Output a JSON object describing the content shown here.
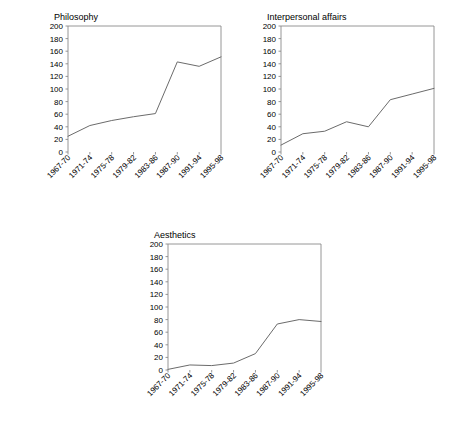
{
  "figure": {
    "background": "#ffffff",
    "line_color": "#6b6b6b",
    "axis_color": "#8a8a8a",
    "text_color": "#000000"
  },
  "panels": [
    {
      "id": "philosophy",
      "title": "Philosophy",
      "x": 40,
      "y": 12
    },
    {
      "id": "interpersonal-affairs",
      "title": "Interpersonal affairs",
      "x": 253,
      "y": 12
    },
    {
      "id": "aesthetics",
      "title": "Aesthetics",
      "x": 140,
      "y": 230
    }
  ],
  "axis": {
    "y_ticks": [
      "200",
      "180",
      "160",
      "140",
      "120",
      "100",
      "80",
      "60",
      "40",
      "20",
      "0"
    ],
    "x_ticks": [
      "1967-70",
      "1971-74",
      "1975-78",
      "1979-82",
      "1983-86",
      "1987-90",
      "1991-94",
      "1995-98"
    ]
  },
  "chart_data": [
    {
      "type": "line",
      "title": "Philosophy",
      "xlabel": "",
      "ylabel": "",
      "categories": [
        "1967-70",
        "1971-74",
        "1975-78",
        "1979-82",
        "1983-86",
        "1987-90",
        "1991-94",
        "1995-98"
      ],
      "values": [
        25,
        42,
        50,
        56,
        61,
        143,
        136,
        151
      ],
      "ylim": [
        0,
        200
      ],
      "yticks": [
        0,
        20,
        40,
        60,
        80,
        100,
        120,
        140,
        160,
        180,
        200
      ],
      "grid": false,
      "legend": "none"
    },
    {
      "type": "line",
      "title": "Interpersonal affairs",
      "xlabel": "",
      "ylabel": "",
      "categories": [
        "1967-70",
        "1971-74",
        "1975-78",
        "1979-82",
        "1983-86",
        "1987-90",
        "1991-94",
        "1995-98"
      ],
      "values": [
        11,
        29,
        33,
        48,
        40,
        83,
        92,
        101
      ],
      "ylim": [
        0,
        200
      ],
      "yticks": [
        0,
        20,
        40,
        60,
        80,
        100,
        120,
        140,
        160,
        180,
        200
      ],
      "grid": false,
      "legend": "none"
    },
    {
      "type": "line",
      "title": "Aesthetics",
      "xlabel": "",
      "ylabel": "",
      "categories": [
        "1967-70",
        "1971-74",
        "1975-78",
        "1979-82",
        "1983-86",
        "1987-90",
        "1991-94",
        "1995-98"
      ],
      "values": [
        1,
        8,
        7,
        11,
        26,
        73,
        80,
        77
      ],
      "ylim": [
        0,
        200
      ],
      "yticks": [
        0,
        20,
        40,
        60,
        80,
        100,
        120,
        140,
        160,
        180,
        200
      ],
      "grid": false,
      "legend": "none"
    }
  ]
}
